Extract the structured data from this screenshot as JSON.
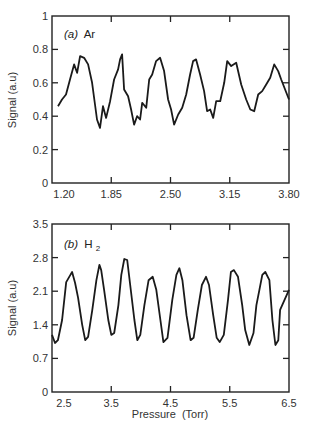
{
  "chart_data": [
    {
      "type": "line",
      "panel_label": "(a) Ar",
      "panel_italic": "(a)",
      "panel_species": "Ar",
      "title": "",
      "xlabel": "",
      "ylabel": "Signal (a.u)",
      "xlim": [
        1.2,
        3.8
      ],
      "ylim": [
        0,
        1
      ],
      "xticks": [
        1.2,
        1.85,
        2.5,
        3.15,
        3.8
      ],
      "xtick_labels": [
        "1.20",
        "1.85",
        "2.50",
        "3.15",
        "3.80"
      ],
      "yticks": [
        0,
        0.2,
        0.4,
        0.6,
        0.8,
        1
      ],
      "ytick_labels": [
        "0",
        "0.2",
        "0.4",
        "0.6",
        "0.8",
        "1"
      ],
      "grid": false,
      "legend": null,
      "series": [
        {
          "name": "Ar",
          "x": [
            1.266,
            1.31,
            1.354,
            1.398,
            1.442,
            1.475,
            1.508,
            1.552,
            1.596,
            1.64,
            1.672,
            1.694,
            1.727,
            1.76,
            1.793,
            1.837,
            1.881,
            1.925,
            1.947,
            1.969,
            1.991,
            2.035,
            2.068,
            2.101,
            2.134,
            2.167,
            2.189,
            2.233,
            2.266,
            2.299,
            2.342,
            2.386,
            2.43,
            2.474,
            2.507,
            2.54,
            2.584,
            2.628,
            2.672,
            2.715,
            2.748,
            2.781,
            2.825,
            2.869,
            2.902,
            2.935,
            2.968,
            3.001,
            3.045,
            3.089,
            3.122,
            3.166,
            3.221,
            3.276,
            3.331,
            3.375,
            3.418,
            3.462,
            3.506,
            3.55,
            3.594,
            3.638,
            3.682,
            3.714,
            3.8
          ],
          "values": [
            0.46,
            0.5,
            0.53,
            0.62,
            0.71,
            0.66,
            0.76,
            0.75,
            0.71,
            0.6,
            0.47,
            0.38,
            0.33,
            0.46,
            0.39,
            0.49,
            0.62,
            0.68,
            0.74,
            0.77,
            0.56,
            0.52,
            0.44,
            0.35,
            0.4,
            0.38,
            0.48,
            0.45,
            0.62,
            0.65,
            0.73,
            0.75,
            0.67,
            0.5,
            0.44,
            0.35,
            0.41,
            0.45,
            0.53,
            0.65,
            0.73,
            0.74,
            0.65,
            0.55,
            0.43,
            0.44,
            0.39,
            0.49,
            0.49,
            0.6,
            0.73,
            0.7,
            0.72,
            0.59,
            0.5,
            0.44,
            0.43,
            0.53,
            0.55,
            0.59,
            0.63,
            0.71,
            0.67,
            0.62,
            0.5
          ]
        }
      ]
    },
    {
      "type": "line",
      "panel_label": "(b) H2",
      "panel_italic": "(b)",
      "panel_species": "H",
      "panel_subscript": "2",
      "title": "",
      "xlabel": "Pressure  (Torr)",
      "ylabel": "Signal (a.u)",
      "xlim": [
        2.5,
        6.5
      ],
      "ylim": [
        0,
        3.5
      ],
      "xticks": [
        2.5,
        3.5,
        4.5,
        5.5,
        6.5
      ],
      "xtick_labels": [
        "2.5",
        "3.5",
        "4.5",
        "5.5",
        "6.5"
      ],
      "yticks": [
        0,
        0.7,
        1.4,
        2.1,
        2.8,
        3.5
      ],
      "ytick_labels": [
        "0",
        "0.7",
        "1.4",
        "2.1",
        "2.8",
        "3.5"
      ],
      "grid": false,
      "legend": null,
      "series": [
        {
          "name": "H2",
          "x": [
            2.5,
            2.55,
            2.6,
            2.67,
            2.74,
            2.81,
            2.84,
            2.89,
            2.94,
            3.01,
            3.06,
            3.11,
            3.18,
            3.25,
            3.3,
            3.33,
            3.38,
            3.45,
            3.5,
            3.55,
            3.62,
            3.67,
            3.72,
            3.77,
            3.82,
            3.89,
            3.94,
            3.99,
            4.06,
            4.13,
            4.2,
            4.26,
            4.33,
            4.38,
            4.45,
            4.53,
            4.6,
            4.65,
            4.7,
            4.77,
            4.84,
            4.89,
            4.96,
            5.03,
            5.1,
            5.15,
            5.22,
            5.28,
            5.33,
            5.4,
            5.47,
            5.52,
            5.57,
            5.64,
            5.71,
            5.76,
            5.83,
            5.9,
            5.95,
            6.0,
            6.05,
            6.1,
            6.17,
            6.22,
            6.27,
            6.32,
            6.35,
            6.5
          ],
          "values": [
            1.19,
            1.02,
            1.08,
            1.5,
            2.29,
            2.44,
            2.5,
            2.27,
            1.96,
            1.4,
            1.08,
            1.15,
            1.71,
            2.33,
            2.65,
            2.54,
            2.13,
            1.5,
            1.19,
            1.23,
            1.81,
            2.44,
            2.77,
            2.75,
            2.23,
            1.5,
            1.08,
            1.19,
            1.81,
            2.33,
            2.4,
            2.13,
            1.5,
            1.04,
            1.13,
            1.92,
            2.44,
            2.58,
            2.33,
            1.6,
            1.08,
            1.13,
            1.71,
            2.23,
            2.4,
            2.23,
            1.6,
            1.13,
            1.04,
            1.19,
            1.92,
            2.5,
            2.54,
            2.4,
            1.81,
            1.29,
            0.98,
            1.23,
            1.81,
            2.13,
            2.44,
            2.5,
            2.33,
            1.5,
            0.98,
            1.08,
            1.71,
            2.13
          ]
        }
      ]
    }
  ]
}
